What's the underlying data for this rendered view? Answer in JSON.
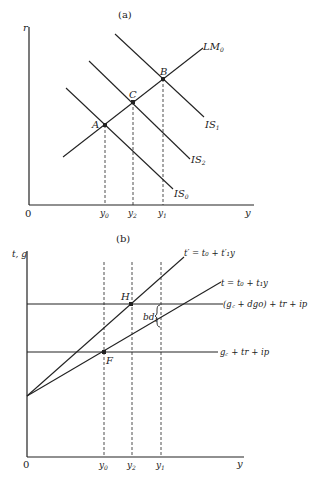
{
  "panel_a": {
    "title": "(a)",
    "y_axis_label": "r",
    "x_axis_label": "y",
    "origin_label": "0",
    "curves": {
      "lm0": "LM",
      "lm0_sub": "0",
      "is1": "IS",
      "is1_sub": "1",
      "is2": "IS",
      "is2_sub": "2",
      "is0": "IS",
      "is0_sub": "0"
    },
    "points": {
      "a": "A",
      "b": "B",
      "c": "C"
    },
    "ticks": {
      "y0": "y",
      "y0_sub": "0",
      "y2": "y",
      "y2_sub": "2",
      "y1": "y",
      "y1_sub": "1"
    }
  },
  "panel_b": {
    "title": "(b)",
    "y_axis_label": "t, g",
    "x_axis_label": "y",
    "origin_label": "0",
    "curves": {
      "t_prime": "t′ = t₀ + t′₁y",
      "t": "t = t₀ + t₁y",
      "upper_spending": "(g꜀ + dgo) + tr + ip",
      "lower_spending": "g꜀ + tr + ip"
    },
    "points": {
      "h": "H",
      "f": "F"
    },
    "gap_label": "bd",
    "gap_label_sub": "1",
    "ticks": {
      "y0": "y",
      "y0_sub": "0",
      "y2": "y",
      "y2_sub": "2",
      "y1": "y",
      "y1_sub": "1"
    }
  },
  "colors": {
    "ink": "#222222",
    "background": "#ffffff"
  }
}
